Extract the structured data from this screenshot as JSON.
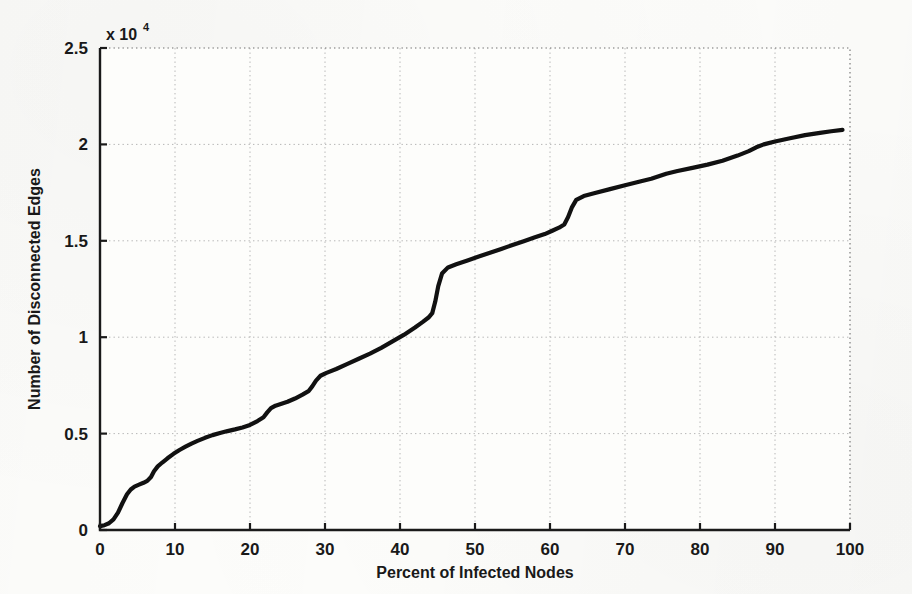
{
  "figure": {
    "background_color": "#fdfdfb",
    "line_color": "#111111",
    "axis_color": "#1a1a1a",
    "grid_color": "#b5b5b5"
  },
  "chart_data": {
    "type": "line",
    "title": "",
    "subtitle": "",
    "xlabel": "Percent of Infected Nodes",
    "ylabel": "Number of Disconnected Edges",
    "y_multiplier_label": "x 10",
    "y_multiplier_exponent": "4",
    "y_multiplier_value": 10000,
    "xlim": [
      0,
      100
    ],
    "ylim": [
      0,
      2.5
    ],
    "xticks": [
      0,
      10,
      20,
      30,
      40,
      50,
      60,
      70,
      80,
      90,
      100
    ],
    "xtick_labels": [
      "0",
      "10",
      "20",
      "30",
      "40",
      "50",
      "60",
      "70",
      "80",
      "90",
      "100"
    ],
    "yticks": [
      0,
      0.5,
      1,
      1.5,
      2,
      2.5
    ],
    "ytick_labels": [
      "0",
      "0.5",
      "1",
      "1.5",
      "2",
      "2.5"
    ],
    "grid": true,
    "grid_style": "dotted",
    "legend": false,
    "legend_position": "none",
    "series": [
      {
        "name": "Disconnected Edges",
        "color": "#111111",
        "line_width": 4.2,
        "x": [
          0,
          0.6,
          1.2,
          1.8,
          2.4,
          3.0,
          3.6,
          4.1,
          4.6,
          5.2,
          5.8,
          6.3,
          6.8,
          7.2,
          7.7,
          8.3,
          9.0,
          9.8,
          10.6,
          11.4,
          12.2,
          13.0,
          14.0,
          15.0,
          16.0,
          17.0,
          18.0,
          19.0,
          20.0,
          21.0,
          21.8,
          22.3,
          22.8,
          23.4,
          24.2,
          25.0,
          26.0,
          27.0,
          27.8,
          28.3,
          28.8,
          29.4,
          30.2,
          31.5,
          33.0,
          34.5,
          36.0,
          37.5,
          39.0,
          40.5,
          42.0,
          43.0,
          43.8,
          44.3,
          44.7,
          45.1,
          45.6,
          46.4,
          47.5,
          49.0,
          50.5,
          52.0,
          53.5,
          55.0,
          56.5,
          58.0,
          59.3,
          60.3,
          61.2,
          61.9,
          62.4,
          62.9,
          63.5,
          64.5,
          66.0,
          68.0,
          70.0,
          72.0,
          73.5,
          74.5,
          75.5,
          77.0,
          79.0,
          81.0,
          83.0,
          85.0,
          86.5,
          87.5,
          88.5,
          90.0,
          92.0,
          94.0,
          96.0,
          97.5,
          99.0
        ],
        "y": [
          0.02,
          0.025,
          0.035,
          0.055,
          0.09,
          0.14,
          0.185,
          0.21,
          0.225,
          0.235,
          0.245,
          0.255,
          0.275,
          0.305,
          0.33,
          0.35,
          0.372,
          0.395,
          0.415,
          0.432,
          0.448,
          0.462,
          0.478,
          0.492,
          0.503,
          0.513,
          0.522,
          0.532,
          0.545,
          0.565,
          0.585,
          0.61,
          0.632,
          0.645,
          0.655,
          0.665,
          0.682,
          0.702,
          0.72,
          0.745,
          0.775,
          0.8,
          0.815,
          0.835,
          0.862,
          0.888,
          0.915,
          0.945,
          0.978,
          1.012,
          1.05,
          1.078,
          1.102,
          1.125,
          1.185,
          1.265,
          1.33,
          1.362,
          1.378,
          1.398,
          1.418,
          1.438,
          1.458,
          1.478,
          1.498,
          1.518,
          1.535,
          1.552,
          1.568,
          1.585,
          1.622,
          1.672,
          1.712,
          1.732,
          1.748,
          1.768,
          1.788,
          1.808,
          1.822,
          1.835,
          1.848,
          1.862,
          1.878,
          1.895,
          1.915,
          1.942,
          1.965,
          1.985,
          2.0,
          2.015,
          2.032,
          2.048,
          2.06,
          2.068,
          2.075
        ]
      }
    ],
    "annotations": [],
    "notable_features": [
      {
        "label": "step",
        "x": 4.1,
        "y": 0.21
      },
      {
        "label": "step",
        "x": 7.2,
        "y": 0.305
      },
      {
        "label": "step",
        "x": 22.3,
        "y": 0.61
      },
      {
        "label": "step",
        "x": 28.3,
        "y": 0.745
      },
      {
        "label": "large-jump",
        "x": 44.7,
        "y": 1.33
      },
      {
        "label": "step",
        "x": 62.4,
        "y": 1.672
      }
    ]
  }
}
